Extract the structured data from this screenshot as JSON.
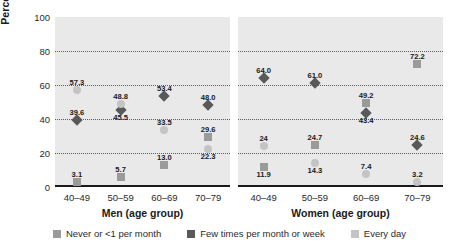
{
  "chart_data": {
    "type": "scatter",
    "title": "",
    "ylabel": "Percentage",
    "ylim": [
      0,
      100
    ],
    "yticks": [
      0,
      20,
      40,
      60,
      80,
      100
    ],
    "grid": "horizontal dotted at 20, 40, 60, 80",
    "legend_position": "bottom-center",
    "categories": [
      "40–49",
      "50–59",
      "60–69",
      "70–79"
    ],
    "panels": [
      {
        "name": "men",
        "xlabel": "Men (age group)",
        "series": [
          {
            "name": "Never or <1 per month",
            "marker": "square",
            "color": "#9a9a9a",
            "values": [
              3.1,
              5.7,
              13.0,
              29.6
            ],
            "labels": [
              "3.1",
              "5.7",
              "13.0",
              "29.6"
            ],
            "label_pos": [
              "above",
              "above",
              "above",
              "above"
            ]
          },
          {
            "name": "Few times per month or week",
            "marker": "diamond",
            "color": "#595959",
            "values": [
              39.6,
              45.5,
              53.4,
              48.0
            ],
            "labels": [
              "39.6",
              "45.5",
              "53.4",
              "48.0"
            ],
            "label_pos": [
              "above",
              "below",
              "above",
              "above"
            ]
          },
          {
            "name": "Every day",
            "marker": "circle",
            "color": "#c4c4c4",
            "values": [
              57.3,
              48.8,
              33.5,
              22.3
            ],
            "labels": [
              "57.3",
              "48.8",
              "33.5",
              "22.3"
            ],
            "label_pos": [
              "above",
              "above",
              "above",
              "below"
            ]
          }
        ]
      },
      {
        "name": "women",
        "xlabel": "Women (age group)",
        "series": [
          {
            "name": "Never or <1 per month",
            "marker": "square",
            "color": "#9a9a9a",
            "values": [
              11.9,
              24.7,
              49.2,
              72.2
            ],
            "labels": [
              "11.9",
              "24.7",
              "49.2",
              "72.2"
            ],
            "label_pos": [
              "below",
              "above",
              "above",
              "above"
            ]
          },
          {
            "name": "Few times per month or week",
            "marker": "diamond",
            "color": "#595959",
            "values": [
              64.0,
              61.0,
              43.4,
              24.6
            ],
            "labels": [
              "64.0",
              "61.0",
              "43.4",
              "24.6"
            ],
            "label_pos": [
              "above",
              "above",
              "below",
              "above"
            ]
          },
          {
            "name": "Every day",
            "marker": "circle",
            "color": "#c4c4c4",
            "values": [
              24.0,
              14.3,
              7.4,
              3.2
            ],
            "labels": [
              "24",
              "14.3",
              "7.4",
              "3.2"
            ],
            "label_pos": [
              "above",
              "below",
              "above",
              "above"
            ]
          }
        ]
      }
    ],
    "legend": [
      {
        "label": "Never or <1 per month",
        "color": "#9a9a9a"
      },
      {
        "label": "Few times per month or week",
        "color": "#595959"
      },
      {
        "label": "Every day",
        "color": "#c4c4c4"
      }
    ]
  }
}
